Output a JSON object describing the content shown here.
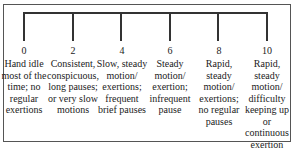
{
  "scale": {
    "title": "",
    "levels": [
      {
        "value": "0",
        "description": "Hand idle\nmost of the\ntime; no\nregular\nexertions"
      },
      {
        "value": "2",
        "description": "Consistent,\nconspicuous,\nlong pauses;\nor very slow\nmotions"
      },
      {
        "value": "4",
        "description": "Slow, steady\nmotion/\nexertions;\nfrequent\nbrief pauses"
      },
      {
        "value": "6",
        "description": "Steady\nmotion/\nexertion;\ninfrequent\npause"
      },
      {
        "value": "8",
        "description": "Rapid, steady\nmotion/\nexertions;\nno regular\npauses"
      },
      {
        "value": "10",
        "description": "Rapid, steady\nmotion/\ndifficulty\nkeeping up or\ncontinuous\nexertion"
      }
    ]
  },
  "colors": {
    "line": "#333333",
    "border": "#555555",
    "text": "#222222",
    "background": "#ffffff"
  }
}
